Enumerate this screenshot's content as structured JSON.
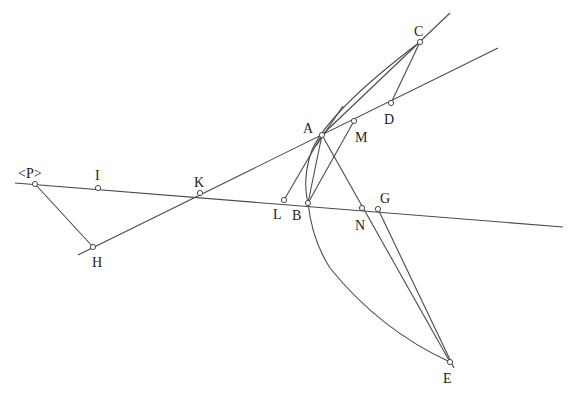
{
  "diagram": {
    "type": "geometric-construction",
    "stroke_color": "#4a4a4a",
    "label_color": "#222222",
    "points": {
      "P": {
        "label": "<P>",
        "x": 35,
        "y": 184,
        "lx": 18,
        "ly": 178
      },
      "I": {
        "label": "I",
        "x": 98,
        "y": 188,
        "lx": 95,
        "ly": 180
      },
      "K": {
        "label": "K",
        "x": 200,
        "y": 193,
        "lx": 194,
        "ly": 187
      },
      "L": {
        "label": "L",
        "x": 284,
        "y": 200,
        "lx": 273,
        "ly": 219
      },
      "B": {
        "label": "B",
        "x": 308,
        "y": 203,
        "lx": 292,
        "ly": 220
      },
      "N": {
        "label": "N",
        "x": 362,
        "y": 208,
        "lx": 355,
        "ly": 230
      },
      "G": {
        "label": "G",
        "x": 378,
        "y": 209,
        "lx": 380,
        "ly": 203
      },
      "H": {
        "label": "H",
        "x": 93,
        "y": 247,
        "lx": 92,
        "ly": 267
      },
      "A": {
        "label": "A",
        "x": 322,
        "y": 135,
        "lx": 303,
        "ly": 133
      },
      "M": {
        "label": "M",
        "x": 354,
        "y": 121,
        "lx": 355,
        "ly": 142
      },
      "D": {
        "label": "D",
        "x": 391,
        "y": 103,
        "lx": 384,
        "ly": 124
      },
      "C": {
        "label": "C",
        "x": 420,
        "y": 42,
        "lx": 414,
        "ly": 36
      },
      "E": {
        "label": "E",
        "x": 450,
        "y": 362,
        "lx": 443,
        "ly": 383
      }
    },
    "lines": [
      {
        "name": "line-P-I-K-L-B-N-G",
        "x1": 15,
        "y1": 183,
        "x2": 563,
        "y2": 227
      },
      {
        "name": "line-H-K-A-M-D",
        "x1": 78,
        "y1": 255,
        "x2": 498,
        "y2": 48
      },
      {
        "name": "line-A-C",
        "x1": 322,
        "y1": 135,
        "x2": 450,
        "y2": 13
      },
      {
        "name": "line-P-H",
        "x1": 35,
        "y1": 184,
        "x2": 93,
        "y2": 247
      },
      {
        "name": "line-C-D",
        "x1": 420,
        "y1": 42,
        "x2": 391,
        "y2": 103
      },
      {
        "name": "line-A-L",
        "x1": 322,
        "y1": 135,
        "x2": 284,
        "y2": 200
      },
      {
        "name": "line-A-B",
        "x1": 322,
        "y1": 135,
        "x2": 308,
        "y2": 203
      },
      {
        "name": "line-M-B",
        "x1": 354,
        "y1": 121,
        "x2": 308,
        "y2": 203
      },
      {
        "name": "line-A-N-E",
        "x1": 322,
        "y1": 135,
        "x2": 450,
        "y2": 362
      },
      {
        "name": "line-G-E",
        "x1": 378,
        "y1": 209,
        "x2": 454,
        "y2": 368
      },
      {
        "name": "tangent-at-A",
        "x1": 316,
        "y1": 146,
        "x2": 343,
        "y2": 106
      }
    ],
    "curves": [
      {
        "name": "curve-C-A-B",
        "d": "M 420 42 Q 330 110 312 150 Q 302 178 308 203"
      },
      {
        "name": "curve-B-E",
        "d": "M 308 203 Q 312 240 330 268 Q 380 330 450 362"
      }
    ]
  }
}
